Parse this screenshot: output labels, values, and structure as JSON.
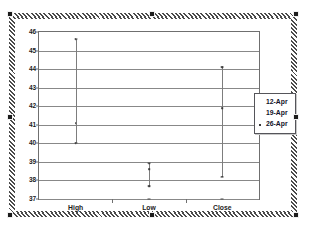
{
  "app": {
    "object_kind": "embedded-chart",
    "selected": true,
    "handle_count": 8
  },
  "chart_data": {
    "type": "line",
    "title": "",
    "subtitle": "",
    "xlabel": "",
    "ylabel": "",
    "categories": [
      "High",
      "Low",
      "Close"
    ],
    "ylim": [
      37,
      46
    ],
    "yticks": [
      46,
      45,
      44,
      43,
      42,
      41,
      40,
      39,
      38,
      37
    ],
    "ytick_labels": [
      "46",
      "45",
      "44",
      "43",
      "42",
      "41",
      "40",
      "39",
      "38",
      "37"
    ],
    "grid": "horizontal",
    "legend_position": "right",
    "legend": [
      "12-Apr",
      "19-Apr",
      "26-Apr"
    ],
    "series": [
      {
        "name": "12-Apr",
        "values": [
          45.6,
          38.9,
          44.1
        ]
      },
      {
        "name": "19-Apr",
        "values": [
          41.1,
          38.6,
          41.9
        ]
      },
      {
        "name": "26-Apr",
        "values": [
          40.0,
          37.7,
          38.2
        ]
      }
    ],
    "ranges": [
      {
        "category": "High",
        "min": 40.0,
        "max": 45.6
      },
      {
        "category": "Low",
        "min": 37.7,
        "max": 38.95
      },
      {
        "category": "Close",
        "min": 38.2,
        "max": 44.1
      }
    ],
    "baseline_markers": [
      {
        "category": "Low",
        "value": 37.0
      },
      {
        "category": "Close",
        "value": 37.0
      }
    ],
    "colors": {
      "gridline": "#888888",
      "axis": "#6f6f6f",
      "series_line": "#7d7d7d",
      "marker": "#4a4a4a",
      "legend_text": "#12122a",
      "plot_background": "#ffffff",
      "selection_handle": "#1c1c1c"
    }
  }
}
